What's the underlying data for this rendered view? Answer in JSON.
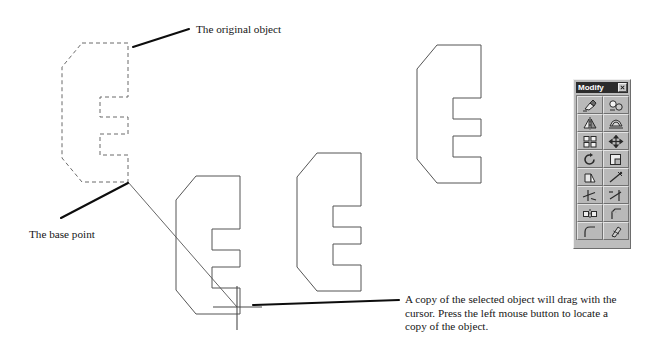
{
  "figure": {
    "annotations": {
      "original_object": "The original object",
      "base_point": "The base point",
      "copy_hint_line1": "A copy of the selected object will drag with the",
      "copy_hint_line2": "cursor. Press the left mouse button to locate a",
      "copy_hint_line3": "copy of the object."
    },
    "colors": {
      "background": "#ffffff",
      "ink": "#161616",
      "object_outline": "#4d4d4d",
      "dashed_outline": "#6b6b6b",
      "leader": "#000000",
      "panel_face": "#bdbdbd",
      "titlebar": "#2c2c2c",
      "titlebar_text": "#ffffff"
    },
    "objects": [
      {
        "name": "original-object-dashed",
        "style": "dashed",
        "state": "selected-source"
      },
      {
        "name": "dragging-copy-outline",
        "style": "solid",
        "state": "drag-preview"
      },
      {
        "name": "placed-copy-middle",
        "style": "solid",
        "state": "placed"
      },
      {
        "name": "placed-copy-right",
        "style": "solid",
        "state": "placed"
      }
    ]
  },
  "toolbar": {
    "title": "Modify",
    "close_label": "×",
    "tools": [
      {
        "label": "Erase",
        "icon": "erase-icon"
      },
      {
        "label": "Copy",
        "icon": "copy-object-icon"
      },
      {
        "label": "Mirror",
        "icon": "mirror-icon"
      },
      {
        "label": "Offset",
        "icon": "offset-icon"
      },
      {
        "label": "Array",
        "icon": "array-icon"
      },
      {
        "label": "Move",
        "icon": "move-icon"
      },
      {
        "label": "Rotate",
        "icon": "rotate-icon"
      },
      {
        "label": "Scale",
        "icon": "scale-icon"
      },
      {
        "label": "Stretch",
        "icon": "stretch-icon"
      },
      {
        "label": "Lengthen",
        "icon": "lengthen-icon"
      },
      {
        "label": "Trim",
        "icon": "trim-icon"
      },
      {
        "label": "Extend",
        "icon": "extend-icon"
      },
      {
        "label": "Break",
        "icon": "break-icon"
      },
      {
        "label": "Chamfer",
        "icon": "chamfer-icon"
      },
      {
        "label": "Fillet",
        "icon": "fillet-icon"
      },
      {
        "label": "Explode",
        "icon": "explode-icon"
      }
    ]
  }
}
